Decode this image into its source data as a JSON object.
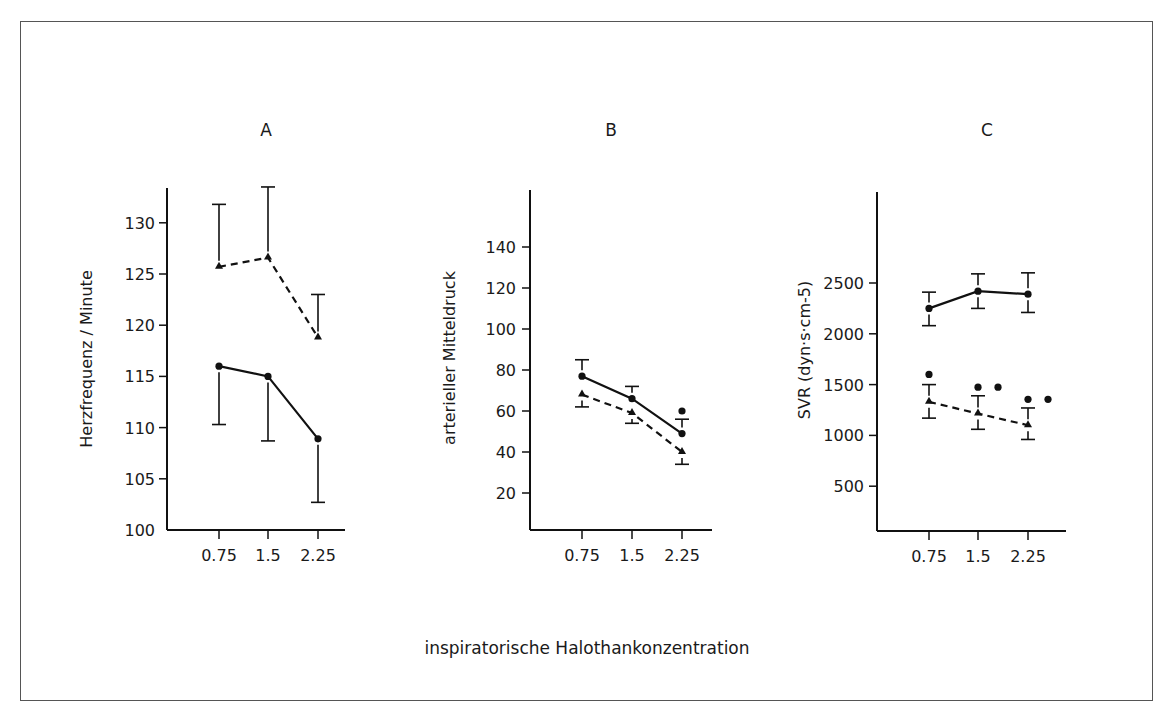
{
  "figure": {
    "xlabel": "inspiratorische Halothankonzentration"
  },
  "chart_data": [
    {
      "type": "line",
      "title": "A",
      "xlabel": "inspiratorische Halothankonzentration",
      "ylabel": "Herzfrequenz / Minute",
      "categories": [
        "0.75",
        "1.5",
        "2.25"
      ],
      "yticks": [
        "100",
        "105",
        "110",
        "115",
        "120",
        "125",
        "130"
      ],
      "ylim": [
        100,
        133
      ],
      "grid": false,
      "series": [
        {
          "name": "triangle-dashed",
          "marker": "triangle",
          "line": "dashed",
          "values": [
            125.7,
            126.6,
            118.8
          ],
          "err_upper": [
            131.8,
            133.5,
            123.0
          ],
          "err_lower": [
            null,
            null,
            null
          ]
        },
        {
          "name": "circle-solid",
          "marker": "circle",
          "line": "solid",
          "values": [
            116.0,
            115.0,
            108.9
          ],
          "err_upper": [
            null,
            null,
            null
          ],
          "err_lower": [
            110.3,
            108.7,
            102.7
          ]
        }
      ]
    },
    {
      "type": "line",
      "title": "B",
      "xlabel": "inspiratorische Halothankonzentration",
      "ylabel": "arterieller Mitteldruck",
      "categories": [
        "0.75",
        "1.5",
        "2.25"
      ],
      "yticks": [
        "20",
        "40",
        "60",
        "80",
        "100",
        "120",
        "140"
      ],
      "ylim": [
        0,
        170
      ],
      "grid": false,
      "series": [
        {
          "name": "circle-solid",
          "marker": "circle",
          "line": "solid",
          "values": [
            77,
            66,
            49
          ],
          "err_upper": [
            85,
            72,
            56
          ],
          "err_lower": [
            null,
            null,
            null
          ]
        },
        {
          "name": "triangle-dashed",
          "marker": "triangle",
          "line": "dashed",
          "values": [
            68,
            59,
            40
          ],
          "err_upper": [
            null,
            null,
            null
          ],
          "err_lower": [
            62,
            54,
            34
          ]
        }
      ],
      "annotations": [
        {
          "type": "significance-dot",
          "x": "2.25",
          "y": 60,
          "count": 1
        }
      ]
    },
    {
      "type": "line",
      "title": "C",
      "xlabel": "inspiratorische Halothankonzentration",
      "ylabel": "SVR (dyn·s·cm-5)",
      "categories": [
        "0.75",
        "1.5",
        "2.25"
      ],
      "yticks": [
        "500",
        "1000",
        "1500",
        "2000",
        "2500"
      ],
      "ylim": [
        0,
        3300
      ],
      "grid": false,
      "series": [
        {
          "name": "circle-solid",
          "marker": "circle",
          "line": "solid",
          "values": [
            2250,
            2420,
            2390
          ],
          "err_upper": [
            2410,
            2590,
            2600
          ],
          "err_lower": [
            2080,
            2250,
            2210
          ]
        },
        {
          "name": "triangle-dashed",
          "marker": "triangle",
          "line": "dashed",
          "values": [
            1330,
            1215,
            1100
          ],
          "err_upper": [
            1500,
            1390,
            1270
          ],
          "err_lower": [
            1170,
            1060,
            960
          ]
        }
      ],
      "annotations": [
        {
          "type": "significance-dot",
          "x": "0.75",
          "y": 1600,
          "count": 1
        },
        {
          "type": "significance-dot",
          "x": "1.5",
          "y": 1475,
          "count": 2
        },
        {
          "type": "significance-dot",
          "x": "2.25",
          "y": 1355,
          "count": 2
        }
      ]
    }
  ]
}
